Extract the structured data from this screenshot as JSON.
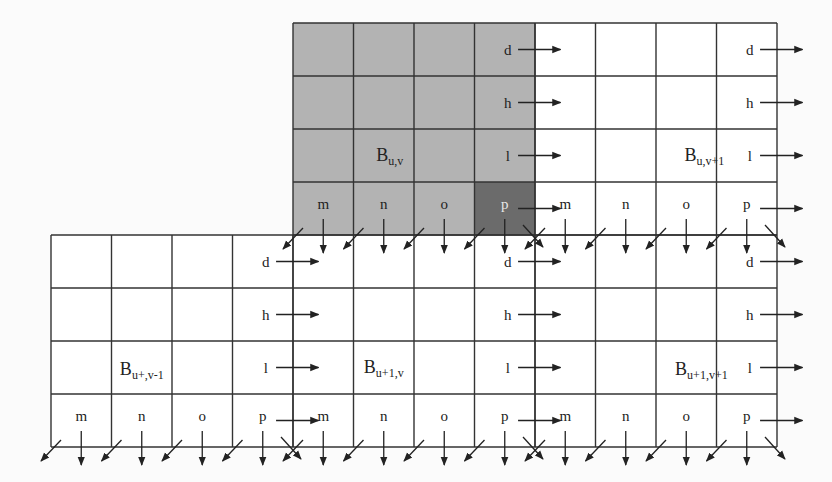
{
  "diagram": {
    "colors": {
      "grid_line": "#333333",
      "shaded_block": "#b3b3b3",
      "highlight_cell": "#6b6b6b",
      "background": "#fbfbfb",
      "arrow": "#222222"
    },
    "blocks": [
      {
        "id": "B_u_v",
        "base": "B",
        "sub": "u,v",
        "shaded": true,
        "col0": 0,
        "row0": 0
      },
      {
        "id": "B_u_v+1",
        "base": "B",
        "sub": "u,v+1",
        "shaded": false,
        "col0": 4,
        "row0": 0
      },
      {
        "id": "B_u+_v-1",
        "base": "B",
        "sub": "u+,v-1",
        "shaded": false,
        "col0": -4,
        "row0": 4
      },
      {
        "id": "B_u+1_v",
        "base": "B",
        "sub": "u+1,v",
        "shaded": false,
        "col0": 0,
        "row0": 4
      },
      {
        "id": "B_u+1_v+1",
        "base": "B",
        "sub": "u+1,v+1",
        "shaded": false,
        "col0": 4,
        "row0": 4
      }
    ],
    "right_column_labels": [
      "d",
      "h",
      "l",
      "p"
    ],
    "bottom_row_labels": [
      "m",
      "n",
      "o",
      "p"
    ],
    "highlight_cell": {
      "block": "B_u_v",
      "label": "p"
    }
  }
}
